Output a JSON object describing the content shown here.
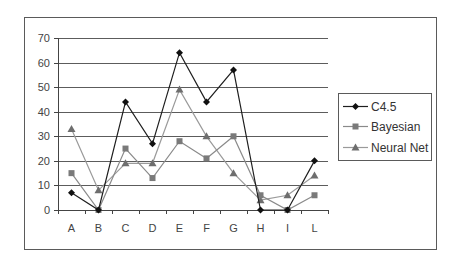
{
  "chart_data": {
    "type": "line",
    "title": "",
    "xlabel": "",
    "ylabel": "",
    "categories": [
      "A",
      "B",
      "C",
      "D",
      "E",
      "F",
      "G",
      "H",
      "I",
      "L"
    ],
    "series": [
      {
        "name": "C4.5",
        "marker": "diamond",
        "color": "#1e1e1e",
        "marker_color": "#111111",
        "values": [
          7,
          0,
          44,
          27,
          64,
          44,
          57,
          0,
          0,
          20
        ]
      },
      {
        "name": "Bayesian",
        "marker": "square",
        "color": "#8a8a8a",
        "marker_color": "#7a7a7a",
        "values": [
          15,
          0,
          25,
          13,
          28,
          21,
          30,
          6,
          0,
          6
        ]
      },
      {
        "name": "Neural Net",
        "marker": "triangle",
        "color": "#9a9a9a",
        "marker_color": "#6e6e6e",
        "values": [
          33,
          8,
          19,
          19,
          49,
          30,
          15,
          4,
          6,
          14
        ]
      }
    ],
    "ylim": [
      0,
      70
    ],
    "yticks": [
      0,
      10,
      20,
      30,
      40,
      50,
      60,
      70
    ],
    "ytick_labels": [
      "0",
      "10",
      "20",
      "30",
      "40",
      "50",
      "60",
      "70"
    ],
    "grid": true,
    "legend_position": "right"
  },
  "colors": {
    "frame": "#5a5a5a",
    "gridline": "#5c5c5c",
    "axis": "#444444",
    "background": "#ffffff"
  }
}
